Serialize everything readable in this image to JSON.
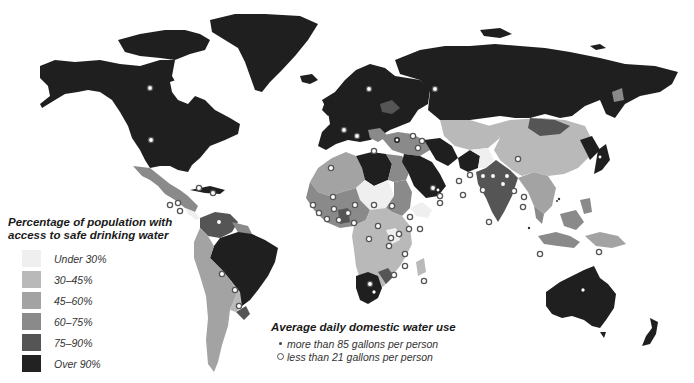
{
  "map": {
    "type": "choropleth world map",
    "colors": {
      "under_30": "#efefef",
      "30_45": "#b9b9b9",
      "45_60": "#a3a3a3",
      "60_75": "#8a8a8a",
      "75_90": "#555555",
      "over_90": "#1f1f1f",
      "ocean": "#ffffff"
    }
  },
  "legend_access": {
    "title_line1": "Percentage of population with",
    "title_line2": "access to safe drinking water",
    "items": [
      {
        "label": "Under 30%",
        "color": "#efefef"
      },
      {
        "label": "30–45%",
        "color": "#b9b9b9"
      },
      {
        "label": "45–60%",
        "color": "#a3a3a3"
      },
      {
        "label": "60–75%",
        "color": "#8a8a8a"
      },
      {
        "label": "75–90%",
        "color": "#555555"
      },
      {
        "label": "Over 90%",
        "color": "#222222"
      }
    ]
  },
  "legend_use": {
    "title": "Average daily domestic water use",
    "items": [
      {
        "symbol": "small-dot",
        "label": "more than 85 gallons per person"
      },
      {
        "symbol": "open-circle",
        "label": "less than 21 gallons per person"
      }
    ]
  }
}
